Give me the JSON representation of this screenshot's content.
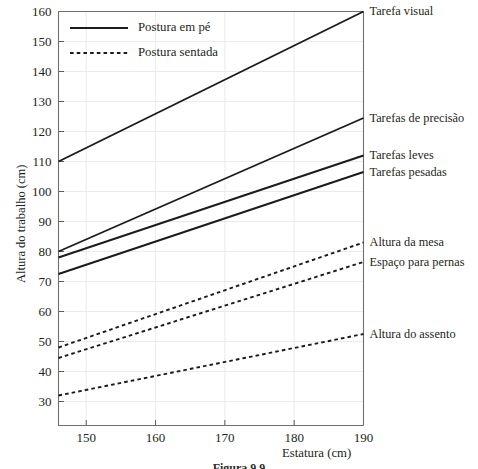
{
  "figure": {
    "caption": "Figura 9.9"
  },
  "chart_data": {
    "type": "line",
    "title": "",
    "xlabel": "Estatura (cm)",
    "ylabel": "Altura do trabalho (cm)",
    "xlim": [
      146,
      190
    ],
    "ylim": [
      22,
      160
    ],
    "xticks": [
      150,
      160,
      170,
      180,
      190
    ],
    "yticks": [
      30,
      40,
      50,
      60,
      70,
      80,
      90,
      100,
      110,
      120,
      130,
      140,
      150,
      160
    ],
    "grid": true,
    "legend_position": "top-left",
    "legend": [
      {
        "label": "Postura em pé",
        "style": "solid"
      },
      {
        "label": "Postura sentada",
        "style": "dotted"
      }
    ],
    "series": [
      {
        "name": "Tarefa visual",
        "style": "solid",
        "x": [
          146,
          190
        ],
        "y": [
          110.0,
          160.0
        ]
      },
      {
        "name": "Tarefas de precisão",
        "style": "solid",
        "x": [
          146,
          190
        ],
        "y": [
          80.0,
          124.5
        ]
      },
      {
        "name": "Tarefas leves",
        "style": "solid",
        "x": [
          146,
          190
        ],
        "y": [
          78.0,
          112.0
        ]
      },
      {
        "name": "Tarefas pesadas",
        "style": "solid",
        "x": [
          146,
          190
        ],
        "y": [
          72.5,
          106.5
        ]
      },
      {
        "name": "Altura da mesa",
        "style": "dotted",
        "x": [
          146,
          190
        ],
        "y": [
          48.0,
          83.0
        ]
      },
      {
        "name": "Espaço para pernas",
        "style": "dotted",
        "x": [
          146,
          190
        ],
        "y": [
          44.5,
          76.5
        ]
      },
      {
        "name": "Altura do assento",
        "style": "dotted",
        "x": [
          146,
          190
        ],
        "y": [
          32.0,
          52.5
        ]
      }
    ],
    "annotations": [
      {
        "text": "Tarefa visual",
        "series": "Tarefa visual"
      },
      {
        "text": "Tarefas de precisão",
        "series": "Tarefas de precisão"
      },
      {
        "text": "Tarefas leves",
        "series": "Tarefas leves"
      },
      {
        "text": "Tarefas pesadas",
        "series": "Tarefas pesadas"
      },
      {
        "text": "Altura da mesa",
        "series": "Altura da mesa"
      },
      {
        "text": "Espaço para pernas",
        "series": "Espaço para pernas"
      },
      {
        "text": "Altura do assento",
        "series": "Altura do assento"
      }
    ],
    "colors": {
      "line": "#1b1b1b",
      "axis": "#6f6f6f",
      "grid": "#e9e9ea",
      "text": "#231f20"
    }
  }
}
